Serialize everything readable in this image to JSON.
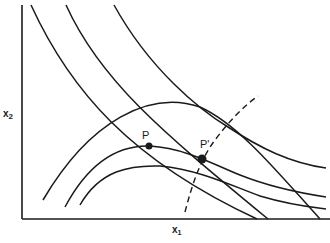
{
  "figure": {
    "type": "economics-diagram",
    "axes": {
      "x_label": "x",
      "x_label_sub": "1",
      "y_label": "x",
      "y_label_sub": "2"
    },
    "points": [
      {
        "label": "P",
        "cx": 149,
        "cy": 146
      },
      {
        "label": "P'",
        "cx": 202,
        "cy": 159
      }
    ],
    "indifference_curves": [
      {
        "name": "convex-curve-1",
        "d": "M31,5 C70,90 130,160 257,219"
      },
      {
        "name": "convex-curve-2",
        "d": "M66,5 C100,80 160,130 268,219"
      },
      {
        "name": "convex-curve-3",
        "d": "M114,5 C150,70 200,110 228,127 C260,148 290,163 326,168"
      }
    ],
    "arch_curves": [
      {
        "name": "upper-arch-curve",
        "d": "M43,200 C90,120 150,90 200,107 C240,125 280,175 320,219"
      },
      {
        "name": "middle-arch-curve",
        "d": "M65,207 C90,160 120,145 150,146 C185,148 215,165 240,175 C270,187 300,193 326,197"
      },
      {
        "name": "lower-arch-curve",
        "d": "M80,205 C100,170 130,165 160,166 C200,170 230,185 260,196 C290,205 310,207 326,209"
      }
    ],
    "expansion_path": {
      "name": "dashed-expansion-path",
      "d": "M185,212 C192,185 200,160 215,140 C230,120 245,105 258,96"
    },
    "colors": {
      "ink": "#1a1a1a",
      "background": "#ffffff"
    }
  }
}
